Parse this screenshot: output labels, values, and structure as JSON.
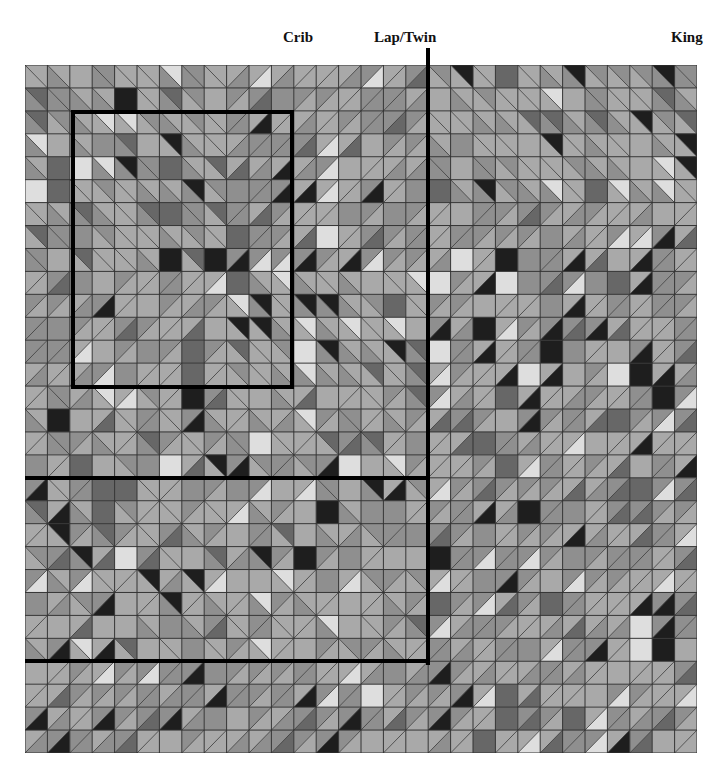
{
  "labels": {
    "crib": "Crib",
    "lap_twin": "Lap/Twin",
    "king": "King"
  },
  "label_positions": {
    "crib": {
      "x": 283
    },
    "lap_twin": {
      "x": 374
    },
    "king": {
      "x": 671
    }
  },
  "quilt": {
    "columns": 30,
    "rows": 30,
    "width": 672,
    "height": 688,
    "pattern": "half-square triangles and solid squares in greys",
    "palette": {
      "light": "#a9a9a9",
      "mid": "#8f8f8f",
      "dark": "#676767",
      "black": "#1e1e1e",
      "white": "#dedede",
      "grid_line": "#333333"
    }
  },
  "size_outlines": [
    {
      "name": "crib-outline",
      "type": "box",
      "col_start": 2,
      "col_end": 12,
      "row_start": 2,
      "row_end": 14
    },
    {
      "name": "lap-twin-outline",
      "type": "corner",
      "col_end": 18,
      "row_end": 18,
      "extends_above": true
    },
    {
      "name": "second-size-bottom",
      "type": "hline",
      "col_end": 18,
      "row": 26
    }
  ]
}
